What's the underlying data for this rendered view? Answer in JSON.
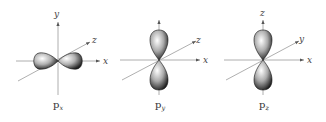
{
  "figure": {
    "panels": [
      {
        "orbital": "p",
        "subscript": "x",
        "lobe_axis": "x",
        "axes": {
          "vertical": "y",
          "horizontal": "x",
          "diagonal": "z"
        }
      },
      {
        "orbital": "p",
        "subscript": "y",
        "lobe_axis": "vertical",
        "axes": {
          "vertical": "",
          "horizontal": "x",
          "diagonal": "z"
        }
      },
      {
        "orbital": "p",
        "subscript": "z",
        "lobe_axis": "vertical",
        "axes": {
          "vertical": "z",
          "horizontal": "x",
          "diagonal": "y"
        }
      }
    ]
  }
}
